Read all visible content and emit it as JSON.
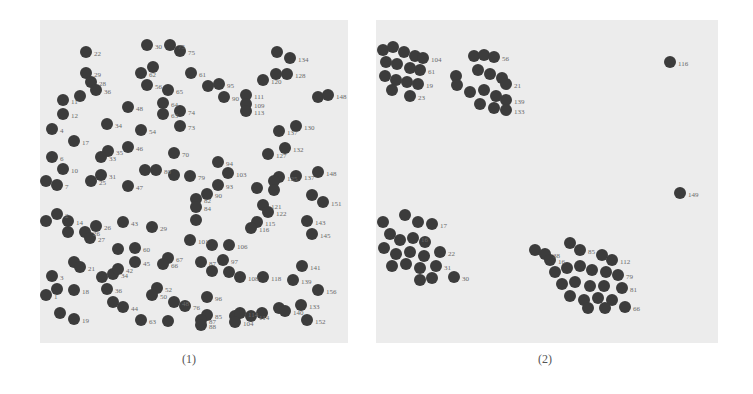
{
  "figure": {
    "captions": [
      "(1)",
      "(2)"
    ]
  },
  "chart_data": [
    {
      "type": "scatter",
      "title": "(1)",
      "xlabel": "",
      "ylabel": "",
      "grid": false,
      "legend": null,
      "description": "Randomly distributed labeled points (initial state)",
      "panel_px": {
        "left": 40,
        "top": 20,
        "width": 308,
        "height": 323
      },
      "points": [
        {
          "x": 86,
          "y": 52,
          "label": "22"
        },
        {
          "x": 147,
          "y": 45,
          "label": "30"
        },
        {
          "x": 170,
          "y": 45,
          "label": "75"
        },
        {
          "x": 180,
          "y": 51,
          "label": "75"
        },
        {
          "x": 277,
          "y": 52,
          "label": ""
        },
        {
          "x": 290,
          "y": 58,
          "label": "134"
        },
        {
          "x": 86,
          "y": 73,
          "label": "29"
        },
        {
          "x": 153,
          "y": 67,
          "label": ""
        },
        {
          "x": 141,
          "y": 73,
          "label": "62"
        },
        {
          "x": 191,
          "y": 73,
          "label": "61"
        },
        {
          "x": 263,
          "y": 80,
          "label": "120"
        },
        {
          "x": 276,
          "y": 74,
          "label": ""
        },
        {
          "x": 287,
          "y": 74,
          "label": "128"
        },
        {
          "x": 91,
          "y": 82,
          "label": "28"
        },
        {
          "x": 96,
          "y": 90,
          "label": "36"
        },
        {
          "x": 147,
          "y": 85,
          "label": "56"
        },
        {
          "x": 168,
          "y": 90,
          "label": "65"
        },
        {
          "x": 208,
          "y": 86,
          "label": ""
        },
        {
          "x": 219,
          "y": 84,
          "label": "95"
        },
        {
          "x": 224,
          "y": 97,
          "label": "90"
        },
        {
          "x": 246,
          "y": 95,
          "label": "111"
        },
        {
          "x": 246,
          "y": 104,
          "label": "109"
        },
        {
          "x": 246,
          "y": 111,
          "label": "113"
        },
        {
          "x": 318,
          "y": 97,
          "label": ""
        },
        {
          "x": 328,
          "y": 95,
          "label": "148"
        },
        {
          "x": 63,
          "y": 100,
          "label": "11"
        },
        {
          "x": 80,
          "y": 96,
          "label": ""
        },
        {
          "x": 128,
          "y": 107,
          "label": "48"
        },
        {
          "x": 163,
          "y": 103,
          "label": "64"
        },
        {
          "x": 63,
          "y": 114,
          "label": "12"
        },
        {
          "x": 163,
          "y": 114,
          "label": "63"
        },
        {
          "x": 180,
          "y": 111,
          "label": "74"
        },
        {
          "x": 180,
          "y": 126,
          "label": "73"
        },
        {
          "x": 107,
          "y": 124,
          "label": "34"
        },
        {
          "x": 141,
          "y": 130,
          "label": "54"
        },
        {
          "x": 52,
          "y": 129,
          "label": "4"
        },
        {
          "x": 279,
          "y": 131,
          "label": "137"
        },
        {
          "x": 296,
          "y": 126,
          "label": "130"
        },
        {
          "x": 74,
          "y": 141,
          "label": "17"
        },
        {
          "x": 128,
          "y": 147,
          "label": "46"
        },
        {
          "x": 108,
          "y": 151,
          "label": "35"
        },
        {
          "x": 101,
          "y": 157,
          "label": "33"
        },
        {
          "x": 174,
          "y": 153,
          "label": "70"
        },
        {
          "x": 285,
          "y": 148,
          "label": "132"
        },
        {
          "x": 268,
          "y": 154,
          "label": "127"
        },
        {
          "x": 52,
          "y": 157,
          "label": "6"
        },
        {
          "x": 63,
          "y": 169,
          "label": "10"
        },
        {
          "x": 218,
          "y": 162,
          "label": "94"
        },
        {
          "x": 228,
          "y": 173,
          "label": "103"
        },
        {
          "x": 46,
          "y": 181,
          "label": ""
        },
        {
          "x": 57,
          "y": 185,
          "label": "7"
        },
        {
          "x": 101,
          "y": 175,
          "label": "31"
        },
        {
          "x": 91,
          "y": 181,
          "label": "25"
        },
        {
          "x": 145,
          "y": 170,
          "label": ""
        },
        {
          "x": 156,
          "y": 170,
          "label": "80"
        },
        {
          "x": 174,
          "y": 175,
          "label": ""
        },
        {
          "x": 190,
          "y": 176,
          "label": "79"
        },
        {
          "x": 279,
          "y": 177,
          "label": "125"
        },
        {
          "x": 274,
          "y": 181,
          "label": ""
        },
        {
          "x": 296,
          "y": 176,
          "label": "137"
        },
        {
          "x": 318,
          "y": 172,
          "label": "148"
        },
        {
          "x": 128,
          "y": 186,
          "label": "47"
        },
        {
          "x": 218,
          "y": 185,
          "label": "93"
        },
        {
          "x": 207,
          "y": 194,
          "label": "90"
        },
        {
          "x": 196,
          "y": 199,
          "label": "82"
        },
        {
          "x": 196,
          "y": 207,
          "label": "84"
        },
        {
          "x": 257,
          "y": 188,
          "label": ""
        },
        {
          "x": 274,
          "y": 190,
          "label": ""
        },
        {
          "x": 312,
          "y": 195,
          "label": ""
        },
        {
          "x": 323,
          "y": 202,
          "label": "151"
        },
        {
          "x": 263,
          "y": 205,
          "label": "121"
        },
        {
          "x": 268,
          "y": 212,
          "label": "122"
        },
        {
          "x": 46,
          "y": 221,
          "label": ""
        },
        {
          "x": 57,
          "y": 214,
          "label": "2"
        },
        {
          "x": 68,
          "y": 221,
          "label": "14"
        },
        {
          "x": 68,
          "y": 232,
          "label": ""
        },
        {
          "x": 85,
          "y": 232,
          "label": "26"
        },
        {
          "x": 96,
          "y": 226,
          "label": "26"
        },
        {
          "x": 90,
          "y": 238,
          "label": "27"
        },
        {
          "x": 123,
          "y": 222,
          "label": "43"
        },
        {
          "x": 152,
          "y": 227,
          "label": "29"
        },
        {
          "x": 196,
          "y": 220,
          "label": ""
        },
        {
          "x": 257,
          "y": 222,
          "label": "115"
        },
        {
          "x": 251,
          "y": 228,
          "label": "116"
        },
        {
          "x": 307,
          "y": 221,
          "label": "143"
        },
        {
          "x": 312,
          "y": 234,
          "label": "145"
        },
        {
          "x": 190,
          "y": 240,
          "label": "101"
        },
        {
          "x": 212,
          "y": 245,
          "label": ""
        },
        {
          "x": 229,
          "y": 245,
          "label": "106"
        },
        {
          "x": 118,
          "y": 249,
          "label": ""
        },
        {
          "x": 135,
          "y": 248,
          "label": "60"
        },
        {
          "x": 135,
          "y": 262,
          "label": "45"
        },
        {
          "x": 168,
          "y": 258,
          "label": "67"
        },
        {
          "x": 163,
          "y": 264,
          "label": "66"
        },
        {
          "x": 74,
          "y": 262,
          "label": ""
        },
        {
          "x": 80,
          "y": 267,
          "label": "21"
        },
        {
          "x": 201,
          "y": 262,
          "label": "87"
        },
        {
          "x": 223,
          "y": 260,
          "label": "97"
        },
        {
          "x": 212,
          "y": 271,
          "label": ""
        },
        {
          "x": 229,
          "y": 272,
          "label": ""
        },
        {
          "x": 240,
          "y": 277,
          "label": "108"
        },
        {
          "x": 263,
          "y": 277,
          "label": "118"
        },
        {
          "x": 302,
          "y": 266,
          "label": "141"
        },
        {
          "x": 293,
          "y": 280,
          "label": "139"
        },
        {
          "x": 52,
          "y": 276,
          "label": "3"
        },
        {
          "x": 102,
          "y": 277,
          "label": ""
        },
        {
          "x": 113,
          "y": 274,
          "label": "34"
        },
        {
          "x": 118,
          "y": 269,
          "label": "42"
        },
        {
          "x": 57,
          "y": 289,
          "label": ""
        },
        {
          "x": 46,
          "y": 295,
          "label": "1"
        },
        {
          "x": 74,
          "y": 290,
          "label": "18"
        },
        {
          "x": 107,
          "y": 289,
          "label": "36"
        },
        {
          "x": 157,
          "y": 288,
          "label": "52"
        },
        {
          "x": 152,
          "y": 295,
          "label": "50"
        },
        {
          "x": 207,
          "y": 297,
          "label": "96"
        },
        {
          "x": 318,
          "y": 290,
          "label": "156"
        },
        {
          "x": 113,
          "y": 302,
          "label": ""
        },
        {
          "x": 123,
          "y": 307,
          "label": "44"
        },
        {
          "x": 174,
          "y": 302,
          "label": "48"
        },
        {
          "x": 185,
          "y": 306,
          "label": "76"
        },
        {
          "x": 279,
          "y": 308,
          "label": ""
        },
        {
          "x": 285,
          "y": 311,
          "label": "140"
        },
        {
          "x": 301,
          "y": 305,
          "label": "133"
        },
        {
          "x": 262,
          "y": 313,
          "label": ""
        },
        {
          "x": 60,
          "y": 313,
          "label": ""
        },
        {
          "x": 74,
          "y": 319,
          "label": "19"
        },
        {
          "x": 141,
          "y": 320,
          "label": "63"
        },
        {
          "x": 168,
          "y": 321,
          "label": ""
        },
        {
          "x": 207,
          "y": 315,
          "label": "85"
        },
        {
          "x": 201,
          "y": 320,
          "label": "87"
        },
        {
          "x": 201,
          "y": 325,
          "label": "88"
        },
        {
          "x": 235,
          "y": 316,
          "label": ""
        },
        {
          "x": 240,
          "y": 313,
          "label": "114"
        },
        {
          "x": 251,
          "y": 316,
          "label": "114"
        },
        {
          "x": 235,
          "y": 322,
          "label": "104"
        },
        {
          "x": 307,
          "y": 320,
          "label": "152"
        }
      ]
    },
    {
      "type": "scatter",
      "title": "(2)",
      "xlabel": "",
      "ylabel": "",
      "grid": false,
      "legend": null,
      "description": "Points grouped into four dense clusters with two outliers (116, 149)",
      "panel_px": {
        "left": 376,
        "top": 20,
        "width": 342,
        "height": 323
      },
      "clusters": [
        {
          "name": "top-left",
          "center": [
            395,
            62
          ],
          "visible_labels": [
            "104",
            "61",
            "19",
            "23"
          ]
        },
        {
          "name": "top-middle",
          "center": [
            485,
            82
          ],
          "visible_labels": [
            "56",
            "21",
            "139",
            "133"
          ]
        },
        {
          "name": "bottom-left",
          "center": [
            415,
            245
          ],
          "visible_labels": [
            "17",
            "16",
            "22",
            "31",
            "30"
          ]
        },
        {
          "name": "bottom-right",
          "center": [
            585,
            275
          ],
          "visible_labels": [
            "38",
            "45",
            "85",
            "112",
            "79",
            "81",
            "66"
          ]
        }
      ],
      "points": [
        {
          "x": 383,
          "y": 50,
          "label": ""
        },
        {
          "x": 393,
          "y": 47,
          "label": ""
        },
        {
          "x": 404,
          "y": 52,
          "label": ""
        },
        {
          "x": 415,
          "y": 56,
          "label": ""
        },
        {
          "x": 423,
          "y": 58,
          "label": "104"
        },
        {
          "x": 386,
          "y": 62,
          "label": ""
        },
        {
          "x": 397,
          "y": 64,
          "label": ""
        },
        {
          "x": 410,
          "y": 68,
          "label": ""
        },
        {
          "x": 420,
          "y": 70,
          "label": "61"
        },
        {
          "x": 385,
          "y": 76,
          "label": ""
        },
        {
          "x": 396,
          "y": 80,
          "label": ""
        },
        {
          "x": 407,
          "y": 82,
          "label": ""
        },
        {
          "x": 418,
          "y": 84,
          "label": "19"
        },
        {
          "x": 392,
          "y": 90,
          "label": ""
        },
        {
          "x": 410,
          "y": 96,
          "label": "23"
        },
        {
          "x": 456,
          "y": 76,
          "label": ""
        },
        {
          "x": 457,
          "y": 85,
          "label": ""
        },
        {
          "x": 474,
          "y": 56,
          "label": ""
        },
        {
          "x": 484,
          "y": 55,
          "label": ""
        },
        {
          "x": 494,
          "y": 57,
          "label": "56"
        },
        {
          "x": 478,
          "y": 70,
          "label": ""
        },
        {
          "x": 490,
          "y": 74,
          "label": ""
        },
        {
          "x": 502,
          "y": 78,
          "label": ""
        },
        {
          "x": 506,
          "y": 84,
          "label": "21"
        },
        {
          "x": 470,
          "y": 92,
          "label": ""
        },
        {
          "x": 484,
          "y": 90,
          "label": ""
        },
        {
          "x": 496,
          "y": 96,
          "label": ""
        },
        {
          "x": 506,
          "y": 100,
          "label": "139"
        },
        {
          "x": 480,
          "y": 104,
          "label": ""
        },
        {
          "x": 494,
          "y": 108,
          "label": ""
        },
        {
          "x": 506,
          "y": 110,
          "label": "133"
        },
        {
          "x": 670,
          "y": 62,
          "label": "116"
        },
        {
          "x": 680,
          "y": 193,
          "label": "149"
        },
        {
          "x": 383,
          "y": 222,
          "label": ""
        },
        {
          "x": 405,
          "y": 215,
          "label": ""
        },
        {
          "x": 418,
          "y": 222,
          "label": ""
        },
        {
          "x": 432,
          "y": 224,
          "label": "17"
        },
        {
          "x": 390,
          "y": 234,
          "label": ""
        },
        {
          "x": 400,
          "y": 240,
          "label": ""
        },
        {
          "x": 413,
          "y": 238,
          "label": "16"
        },
        {
          "x": 425,
          "y": 242,
          "label": ""
        },
        {
          "x": 384,
          "y": 248,
          "label": ""
        },
        {
          "x": 396,
          "y": 254,
          "label": ""
        },
        {
          "x": 410,
          "y": 252,
          "label": ""
        },
        {
          "x": 424,
          "y": 256,
          "label": ""
        },
        {
          "x": 440,
          "y": 252,
          "label": "22"
        },
        {
          "x": 392,
          "y": 266,
          "label": ""
        },
        {
          "x": 406,
          "y": 264,
          "label": ""
        },
        {
          "x": 420,
          "y": 268,
          "label": ""
        },
        {
          "x": 436,
          "y": 266,
          "label": "31"
        },
        {
          "x": 420,
          "y": 280,
          "label": ""
        },
        {
          "x": 432,
          "y": 278,
          "label": ""
        },
        {
          "x": 454,
          "y": 277,
          "label": "30"
        },
        {
          "x": 535,
          "y": 250,
          "label": ""
        },
        {
          "x": 545,
          "y": 254,
          "label": "38"
        },
        {
          "x": 550,
          "y": 260,
          "label": "16"
        },
        {
          "x": 570,
          "y": 243,
          "label": ""
        },
        {
          "x": 580,
          "y": 250,
          "label": "85"
        },
        {
          "x": 602,
          "y": 255,
          "label": ""
        },
        {
          "x": 612,
          "y": 260,
          "label": "112"
        },
        {
          "x": 555,
          "y": 272,
          "label": ""
        },
        {
          "x": 567,
          "y": 268,
          "label": ""
        },
        {
          "x": 580,
          "y": 266,
          "label": ""
        },
        {
          "x": 592,
          "y": 270,
          "label": ""
        },
        {
          "x": 606,
          "y": 272,
          "label": ""
        },
        {
          "x": 618,
          "y": 275,
          "label": "79"
        },
        {
          "x": 562,
          "y": 284,
          "label": ""
        },
        {
          "x": 575,
          "y": 282,
          "label": ""
        },
        {
          "x": 590,
          "y": 286,
          "label": ""
        },
        {
          "x": 604,
          "y": 286,
          "label": ""
        },
        {
          "x": 622,
          "y": 288,
          "label": "81"
        },
        {
          "x": 570,
          "y": 296,
          "label": ""
        },
        {
          "x": 584,
          "y": 300,
          "label": ""
        },
        {
          "x": 598,
          "y": 298,
          "label": ""
        },
        {
          "x": 612,
          "y": 300,
          "label": ""
        },
        {
          "x": 588,
          "y": 308,
          "label": ""
        },
        {
          "x": 605,
          "y": 308,
          "label": ""
        },
        {
          "x": 625,
          "y": 307,
          "label": "66"
        }
      ]
    }
  ]
}
